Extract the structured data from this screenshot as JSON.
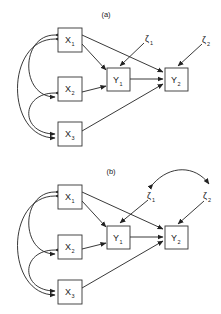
{
  "panels": [
    {
      "title": "(a)",
      "nodes": {
        "x1": {
          "base": "X",
          "sub": "1"
        },
        "x2": {
          "base": "X",
          "sub": "2"
        },
        "x3": {
          "base": "X",
          "sub": "3"
        },
        "y1": {
          "base": "Y",
          "sub": "1"
        },
        "y2": {
          "base": "Y",
          "sub": "2"
        },
        "z1": {
          "base": "ζ",
          "sub": "1"
        },
        "z2": {
          "base": "ζ",
          "sub": "2"
        }
      },
      "paths": [
        "X1->Y1",
        "X1->Y2",
        "X2->Y1",
        "X3->Y2",
        "Y1->Y2",
        "ζ1->Y1",
        "ζ2->Y2",
        "X1<->X2",
        "X2<->X3",
        "X1<->X3"
      ]
    },
    {
      "title": "(b)",
      "nodes": {
        "x1": {
          "base": "X",
          "sub": "1"
        },
        "x2": {
          "base": "X",
          "sub": "2"
        },
        "x3": {
          "base": "X",
          "sub": "3"
        },
        "y1": {
          "base": "Y",
          "sub": "1"
        },
        "y2": {
          "base": "Y",
          "sub": "2"
        },
        "z1": {
          "base": "ζ",
          "sub": "1"
        },
        "z2": {
          "base": "ζ",
          "sub": "2"
        }
      },
      "paths": [
        "X1->Y1",
        "X1->Y2",
        "X2->Y1",
        "X3->Y2",
        "Y1->Y2",
        "ζ1->Y1",
        "ζ2->Y2",
        "X1<->X2",
        "X2<->X3",
        "X1<->X3",
        "ζ1<->ζ2"
      ]
    }
  ]
}
